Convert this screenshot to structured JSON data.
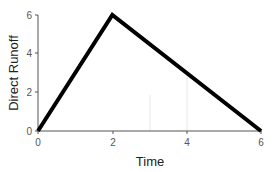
{
  "chart_data": {
    "type": "line",
    "title": "",
    "xlabel": "Time",
    "ylabel": "Direct Runoff",
    "x": [
      0,
      2,
      6
    ],
    "series": [
      {
        "name": "Direct Runoff",
        "values": [
          0,
          6,
          0
        ],
        "color": "#000000"
      }
    ],
    "xlim": [
      0,
      6
    ],
    "ylim": [
      0,
      6
    ],
    "xticks": [
      "0",
      "2",
      "4",
      "6"
    ],
    "yticks": [
      "0",
      "2",
      "4",
      "6"
    ],
    "grid": false,
    "legend": "none"
  }
}
